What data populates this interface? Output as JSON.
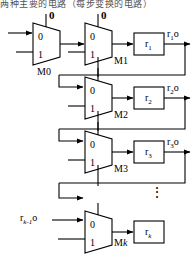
{
  "figure": {
    "caption_fragment": "两种主要的电路（每步变换的电路）",
    "type": "digital-circuit-block-diagram",
    "stroke_color": "#000000",
    "background_color": "#ffffff"
  },
  "muxes": [
    {
      "name": "M0",
      "label": "M0",
      "select_label": "0",
      "input_top": "0",
      "input_bottom": "1"
    },
    {
      "name": "M1",
      "label": "M1",
      "select_label": "0",
      "input_top": "0",
      "input_bottom": "1"
    },
    {
      "name": "M2",
      "label": "M2",
      "select_label": "",
      "input_top": "0",
      "input_bottom": "1"
    },
    {
      "name": "M3",
      "label": "M3",
      "select_label": "",
      "input_top": "0",
      "input_bottom": "1"
    },
    {
      "name": "Mk",
      "label_prefix": "M",
      "label_italic": "k",
      "select_label": "",
      "input_top": "0",
      "input_bottom": "1"
    }
  ],
  "registers": [
    {
      "name": "r1",
      "label_base": "r",
      "label_sub": "1",
      "out_base": "r",
      "out_sub": "1",
      "out_suffix": "o"
    },
    {
      "name": "r2",
      "label_base": "r",
      "label_sub": "2",
      "out_base": "r",
      "out_sub": "2",
      "out_suffix": "o"
    },
    {
      "name": "r3",
      "label_base": "r",
      "label_sub": "3",
      "out_base": "r",
      "out_sub": "3",
      "out_suffix": "o"
    },
    {
      "name": "rk",
      "label_base": "r",
      "label_sub": "k",
      "out_base": "",
      "out_sub": "",
      "out_suffix": ""
    }
  ],
  "signals": {
    "bottom_input_base": "r",
    "bottom_input_sub": "k-1",
    "bottom_input_suffix": "o"
  },
  "ellipsis": "⋮"
}
